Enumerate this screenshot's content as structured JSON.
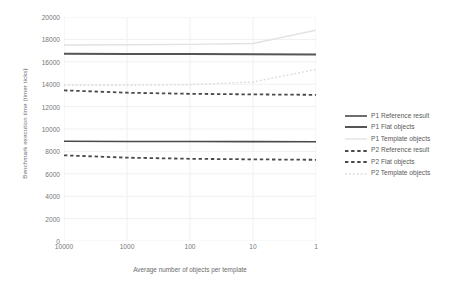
{
  "chart_data": {
    "type": "line",
    "title": "",
    "xlabel": "Average number of objects per template",
    "ylabel": "Benchmark execution time (timer ticks)",
    "xticklabels": [
      "10000",
      "1000",
      "100",
      "10",
      "1"
    ],
    "x_scale": "log-reversed",
    "x": [
      10000,
      1000,
      100,
      10,
      1
    ],
    "yticklabels": [
      "0",
      "2000",
      "4000",
      "6000",
      "8000",
      "10000",
      "12000",
      "14000",
      "16000",
      "18000",
      "20000"
    ],
    "ylim": [
      0,
      20000
    ],
    "ytick_step": 2000,
    "grid": "faint-vertical-and-horizontal",
    "legend_position": "right",
    "series": [
      {
        "name": "P1 Reference result",
        "style": "solid",
        "color": "#4a4a4a",
        "width": 1.6,
        "values": [
          8900,
          8890,
          8880,
          8870,
          8860
        ]
      },
      {
        "name": "P1 Flat objects",
        "style": "solid",
        "color": "#555555",
        "width": 2.0,
        "values": [
          16720,
          16700,
          16690,
          16680,
          16650
        ]
      },
      {
        "name": "P1 Template objects",
        "style": "solid",
        "color": "#e2e2e2",
        "width": 1.4,
        "values": [
          17500,
          17520,
          17560,
          17640,
          18820
        ]
      },
      {
        "name": "P2 Reference result",
        "style": "dashed",
        "color": "#4a4a4a",
        "width": 1.8,
        "values": [
          7650,
          7440,
          7340,
          7290,
          7250
        ]
      },
      {
        "name": "P2 Flat objects",
        "style": "dashed",
        "color": "#4a4a4a",
        "width": 1.8,
        "values": [
          13450,
          13240,
          13140,
          13090,
          13050
        ]
      },
      {
        "name": "P2 Template objects",
        "style": "dotted",
        "color": "#dcdcdc",
        "width": 1.4,
        "values": [
          13900,
          13900,
          13960,
          14200,
          15320
        ]
      }
    ]
  },
  "legend": {
    "items": [
      {
        "label": "P1 Reference result"
      },
      {
        "label": "P1 Flat objects"
      },
      {
        "label": "P1 Template objects"
      },
      {
        "label": "P2 Reference result"
      },
      {
        "label": "P2 Flat objects"
      },
      {
        "label": "P2 Template objects"
      }
    ]
  },
  "colors": {
    "dark_line": "#4a4a4a",
    "light_line": "#e2e2e2",
    "grid": "#f0f0f0",
    "tick_text": "#767676",
    "axis_title": "#6b6b6b",
    "background": "#ffffff"
  }
}
